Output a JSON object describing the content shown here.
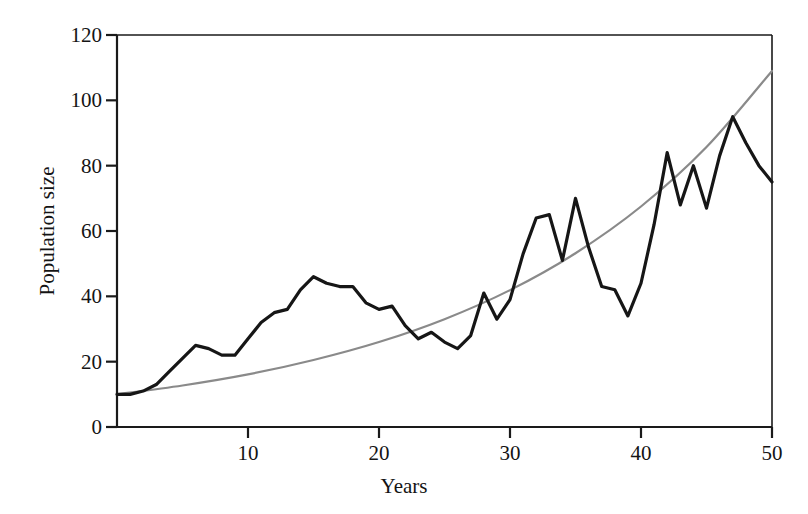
{
  "chart_data": {
    "type": "line",
    "title": "",
    "xlabel": "Years",
    "ylabel": "Population size",
    "xlim": [
      0,
      50
    ],
    "ylim": [
      0,
      120
    ],
    "xticks": [
      10,
      20,
      30,
      40,
      50
    ],
    "yticks": [
      0,
      20,
      40,
      60,
      80,
      100,
      120
    ],
    "grid": false,
    "legend": "none",
    "background": "#ffffff",
    "axis_color": "#1a1a1a",
    "series": [
      {
        "name": "stochastic-population",
        "color": "#161616",
        "line_width": 3.2,
        "style": "solid-jagged",
        "x": [
          0,
          1,
          2,
          3,
          4,
          5,
          6,
          7,
          8,
          9,
          10,
          11,
          12,
          13,
          14,
          15,
          16,
          17,
          18,
          19,
          20,
          21,
          22,
          23,
          24,
          25,
          26,
          27,
          28,
          29,
          30,
          31,
          32,
          33,
          34,
          35,
          36,
          37,
          38,
          39,
          40,
          41,
          42,
          43,
          44,
          45,
          46,
          47,
          48,
          49,
          50
        ],
        "values": [
          10,
          10,
          11,
          13,
          17,
          21,
          25,
          24,
          22,
          22,
          27,
          32,
          35,
          36,
          42,
          46,
          44,
          43,
          43,
          38,
          36,
          37,
          31,
          27,
          29,
          26,
          24,
          28,
          41,
          33,
          39,
          53,
          64,
          65,
          51,
          70,
          55,
          43,
          42,
          34,
          44,
          62,
          84,
          68,
          80,
          67,
          83,
          95,
          87,
          80,
          75
        ]
      },
      {
        "name": "deterministic-exponential",
        "color": "#8a8a8a",
        "line_width": 2.2,
        "style": "smooth-exponential",
        "equation": "N = 10 * exp(0.0478 * t)",
        "x": [
          0,
          5,
          10,
          15,
          20,
          25,
          30,
          35,
          40,
          45,
          50
        ],
        "values": [
          10,
          12.7,
          16.1,
          20.5,
          26.0,
          33.0,
          41.9,
          53.2,
          67.5,
          85.7,
          109
        ]
      }
    ]
  },
  "axes": {
    "y_tick_labels": [
      "0",
      "20",
      "40",
      "60",
      "80",
      "100",
      "120"
    ],
    "x_tick_labels": [
      "10",
      "20",
      "30",
      "40",
      "50"
    ],
    "x_title": "Years",
    "y_title": "Population size"
  }
}
